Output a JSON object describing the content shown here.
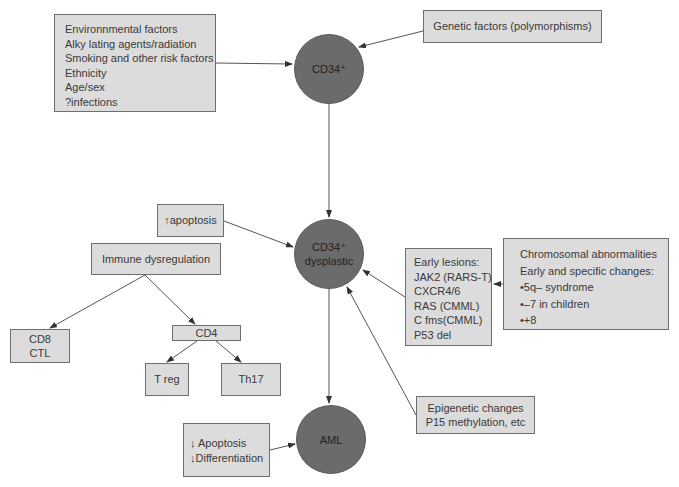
{
  "diagram": {
    "nodes": {
      "cd34": {
        "label": "CD34⁺"
      },
      "cd34_dysplastic": {
        "lines": [
          "CD34⁺",
          "dysplastic"
        ]
      },
      "aml": {
        "label": "AML"
      }
    },
    "boxes": {
      "environmental": {
        "lines": [
          "Environnmental factors",
          "Alky lating agents/radiation",
          "Smoking and other risk factors",
          "Ethnicity",
          "Age/sex",
          "?infections"
        ]
      },
      "genetic": {
        "label": "Genetic factors (polymorphisms)"
      },
      "increased_apoptosis": {
        "label": "↑apoptosis"
      },
      "immune_dysregulation": {
        "label": "Immune dysregulation"
      },
      "cd8": {
        "lines": [
          "CD8",
          "CTL"
        ]
      },
      "cd4": {
        "label": "CD4"
      },
      "treg": {
        "label": "T reg"
      },
      "th17": {
        "label": "Th17"
      },
      "early_lesions": {
        "lines": [
          "Early lesions:",
          "JAK2 (RARS-T)",
          "CXCR4/6",
          "RAS (CMML)",
          "C fms(CMML)",
          "P53 del"
        ]
      },
      "chromosomal": {
        "lines": [
          "Chromosomal abnormalities",
          "Early and specific changes:",
          "•5q– syndrome",
          "•–7 in children",
          "•+8"
        ]
      },
      "epigenetic": {
        "lines": [
          "Epigenetic changes",
          "P15 methylation, etc"
        ]
      },
      "decreased": {
        "lines": [
          "↓ Apoptosis",
          "↓Differentiation"
        ]
      }
    },
    "colors": {
      "box_fill": "#dcdcdc",
      "box_border": "#6e6e6e",
      "node_fill": "#6b6b6b",
      "line": "#555555"
    }
  }
}
